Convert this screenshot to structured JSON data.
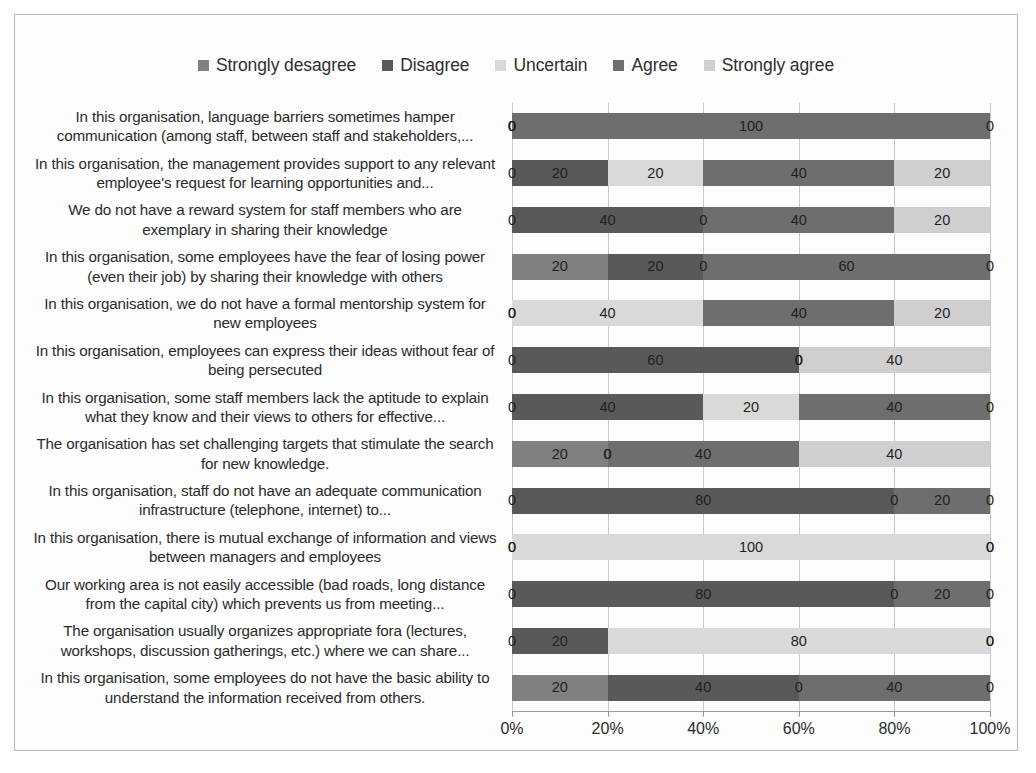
{
  "chart_data": {
    "type": "bar",
    "orientation": "horizontal",
    "stacked": true,
    "normalized_percent": true,
    "title": "",
    "xlabel": "",
    "ylabel": "",
    "xlim": [
      0,
      100
    ],
    "xticks": [
      0,
      20,
      40,
      60,
      80,
      100
    ],
    "xticklabels": [
      "0%",
      "20%",
      "40%",
      "60%",
      "80%",
      "100%"
    ],
    "grid": true,
    "legend_position": "top-center",
    "show_data_labels": true,
    "series": [
      {
        "name": "Strongly desagree",
        "color": "#808080",
        "values": [
          0,
          0,
          0,
          20,
          0,
          0,
          0,
          20,
          0,
          0,
          0,
          0,
          20
        ]
      },
      {
        "name": "Disagree",
        "color": "#595959",
        "values": [
          0,
          20,
          40,
          20,
          0,
          60,
          40,
          0,
          80,
          0,
          80,
          20,
          40
        ]
      },
      {
        "name": "Uncertain",
        "color": "#d9d9d9",
        "values": [
          0,
          20,
          0,
          0,
          40,
          0,
          20,
          0,
          0,
          100,
          0,
          80,
          0
        ]
      },
      {
        "name": "Agree",
        "color": "#6e6e6e",
        "values": [
          100,
          40,
          40,
          60,
          40,
          0,
          40,
          40,
          20,
          0,
          20,
          0,
          40
        ]
      },
      {
        "name": "Strongly agree",
        "color": "#cfcfcf",
        "values": [
          0,
          20,
          20,
          0,
          20,
          40,
          0,
          40,
          0,
          0,
          0,
          0,
          0
        ]
      }
    ],
    "categories": [
      "In this organisation, language barriers sometimes hamper communication (among staff, between staff and stakeholders,...",
      "In this organisation, the management provides support to any relevant employee's request for learning opportunities and...",
      "We do not have a reward system for staff members who are exemplary in sharing their knowledge",
      "In this organisation, some employees have the fear of losing power (even their job) by sharing their knowledge with others",
      "In this organisation, we do not have a formal mentorship system for new employees",
      "In this organisation, employees can express their ideas without fear of being persecuted",
      "In this organisation, some staff members lack the aptitude to explain what they know and their views to others for effective...",
      "The organisation has set challenging targets that stimulate the search for new knowledge.",
      "In this organisation, staff do not have an adequate communication infrastructure (telephone, internet) to...",
      "In this organisation, there is mutual exchange of information and views between managers and employees",
      "Our working area is not easily accessible (bad roads, long distance from the capital city) which prevents us from meeting...",
      "The organisation usually organizes appropriate fora (lectures, workshops, discussion gatherings, etc.) where we can share...",
      "In this organisation, some employees do not have the basic ability to understand the information received from others."
    ]
  }
}
